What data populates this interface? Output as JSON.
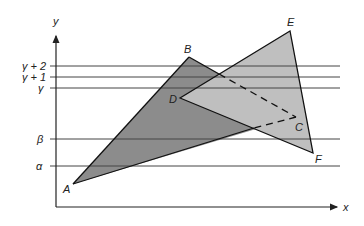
{
  "diagram": {
    "axes": {
      "x_label": "x",
      "y_label": "y",
      "origin": [
        56,
        207
      ],
      "x_end": 340,
      "y_end": 33
    },
    "scanlines": [
      {
        "label": "γ + 2",
        "y": 66
      },
      {
        "label": "γ + 1",
        "y": 77
      },
      {
        "label": "γ",
        "y": 88
      },
      {
        "label": "β",
        "y": 139
      },
      {
        "label": "α",
        "y": 166
      }
    ],
    "triangles": [
      {
        "name": "ABC",
        "fill": "#8c8c8c",
        "vertices": {
          "A": [
            73,
            184
          ],
          "B": [
            189,
            57
          ],
          "C": [
            296,
            117
          ]
        }
      },
      {
        "name": "DEF",
        "fill": "#bdbdbd",
        "vertices": {
          "D": [
            180,
            98
          ],
          "E": [
            290,
            31
          ],
          "F": [
            313,
            153
          ]
        }
      }
    ],
    "vertex_labels": {
      "A": "A",
      "B": "B",
      "C": "C",
      "D": "D",
      "E": "E",
      "F": "F"
    }
  }
}
